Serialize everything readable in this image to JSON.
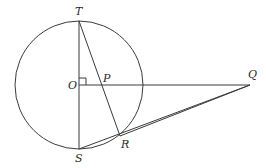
{
  "diagram": {
    "type": "geometry",
    "circle": {
      "center": "O",
      "cx": 79,
      "cy": 85,
      "r": 64
    },
    "points": {
      "T": {
        "x": 79,
        "y": 21
      },
      "O": {
        "x": 79,
        "y": 85
      },
      "S": {
        "x": 79,
        "y": 149
      },
      "P": {
        "x": 102,
        "y": 85
      },
      "Q": {
        "x": 250,
        "y": 85
      },
      "R": {
        "x": 120,
        "y": 136
      }
    },
    "labels": {
      "T": "T",
      "O": "O",
      "P": "P",
      "Q": "Q",
      "R": "R",
      "S": "S"
    },
    "segments": [
      "TS",
      "TR",
      "OQ",
      "SQ",
      "RQ"
    ],
    "right_angle_at": "O",
    "stroke_color": "#3a3a3a"
  }
}
